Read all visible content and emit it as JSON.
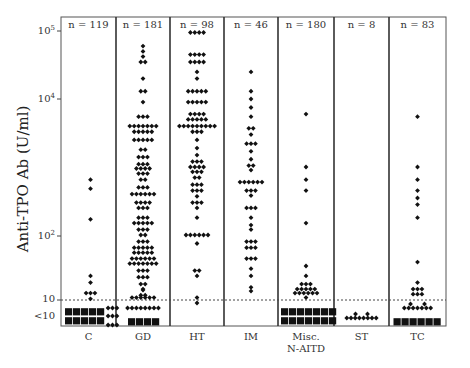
{
  "chart_data": {
    "type": "scatter",
    "subtype": "dot-plot (column scatter, log scale)",
    "title": "",
    "ylabel": "Anti-TPO Ab (U/ml)",
    "xlabel": "",
    "yscale": "log",
    "ylim": [
      5,
      100000
    ],
    "y_ticks": [
      {
        "label": "10^5",
        "value": 100000
      },
      {
        "label": "10^4",
        "value": 10000
      },
      {
        "label": "10^2",
        "value": 100
      },
      {
        "label": "10",
        "value": 10
      },
      {
        "label": "<10",
        "value": "below detection"
      }
    ],
    "threshold_line": {
      "value": 10,
      "style": "dotted"
    },
    "categories": [
      "C",
      "GD",
      "HT",
      "IM",
      "Misc. N-AITD",
      "ST",
      "TC"
    ],
    "n_labels": [
      "n = 119",
      "n = 181",
      "n = 98",
      "n = 46",
      "n = 180",
      "n = 8",
      "n = 83"
    ],
    "n_values": [
      119,
      181,
      98,
      46,
      180,
      8,
      83
    ],
    "series": [
      {
        "name": "C",
        "n": 119,
        "above_10_approx": [
          650,
          480,
          170,
          25,
          15,
          13,
          13,
          13,
          11
        ],
        "below_10_blocks": 10
      },
      {
        "name": "GD",
        "n": 181,
        "range_approx": [
          5,
          60000
        ],
        "below_10_blocks": 4
      },
      {
        "name": "HT",
        "n": 98,
        "range_approx": [
          9,
          95000
        ],
        "below_10_blocks": 0
      },
      {
        "name": "IM",
        "n": 46,
        "range_approx": [
          15,
          25000
        ],
        "below_10_blocks": 0
      },
      {
        "name": "Misc. N-AITD",
        "n": 180,
        "above_10_approx": [
          6000,
          1000,
          650,
          450,
          150,
          35,
          25,
          20,
          18,
          16,
          15,
          14,
          13,
          12
        ],
        "below_10_blocks": 16
      },
      {
        "name": "ST",
        "n": 8,
        "values_approx": "all <10 (around 5-7)"
      },
      {
        "name": "TC",
        "n": 83,
        "above_10_approx": [
          5500,
          1000,
          650,
          450,
          350,
          280,
          180,
          40,
          20,
          15,
          14,
          13,
          12
        ],
        "below_10_blocks": 6
      }
    ]
  }
}
